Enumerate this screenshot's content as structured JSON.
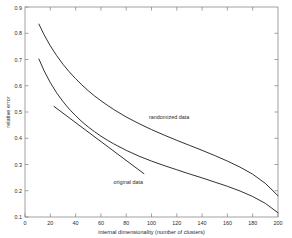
{
  "chart_data": {
    "type": "line",
    "title": "",
    "subtitle": "",
    "xlabel": "internal dimensionality (number of clusters)",
    "ylabel": "relative error",
    "xlim": [
      0,
      200
    ],
    "ylim": [
      0.1,
      0.9
    ],
    "grid": false,
    "legend_position": "inline-annotations",
    "xticks": [
      0,
      20,
      40,
      60,
      80,
      100,
      120,
      140,
      160,
      180,
      200
    ],
    "xtick_labels": [
      "0",
      "20",
      "40",
      "60",
      "80",
      "100",
      "120",
      "140",
      "160",
      "180",
      "200"
    ],
    "yticks": [
      0.1,
      0.2,
      0.3,
      0.4,
      0.5,
      0.6,
      0.7,
      0.8,
      0.9
    ],
    "ytick_labels": [
      "0.1",
      "0.2",
      "0.3",
      "0.4",
      "0.5",
      "0.6",
      "0.7",
      "0.8",
      "0.9"
    ],
    "series": [
      {
        "name": "randomized data",
        "x": [
          11,
          15,
          20,
          25,
          30,
          35,
          40,
          45,
          50,
          55,
          60,
          65,
          70,
          80,
          90,
          100,
          110,
          120,
          130,
          140,
          150,
          160,
          170,
          180,
          190,
          200
        ],
        "values": [
          0.835,
          0.795,
          0.752,
          0.715,
          0.682,
          0.653,
          0.627,
          0.603,
          0.581,
          0.561,
          0.543,
          0.526,
          0.51,
          0.481,
          0.456,
          0.433,
          0.412,
          0.392,
          0.373,
          0.354,
          0.334,
          0.313,
          0.29,
          0.263,
          0.228,
          0.181
        ]
      },
      {
        "name": "original data",
        "x": [
          11,
          15,
          20,
          25,
          30,
          35,
          40,
          45,
          50,
          55,
          60,
          65,
          70,
          80,
          90,
          100,
          110,
          120,
          130,
          140,
          150,
          160,
          170,
          180,
          190,
          200
        ],
        "values": [
          0.702,
          0.658,
          0.612,
          0.573,
          0.54,
          0.511,
          0.486,
          0.463,
          0.443,
          0.425,
          0.408,
          0.393,
          0.379,
          0.354,
          0.332,
          0.313,
          0.296,
          0.28,
          0.264,
          0.249,
          0.233,
          0.217,
          0.199,
          0.178,
          0.152,
          0.116
        ]
      },
      {
        "name": "tangent-line",
        "x": [
          23,
          94
        ],
        "values": [
          0.521,
          0.265
        ]
      }
    ],
    "annotations": [
      {
        "text": "randomized data",
        "x": 98,
        "y": 0.475
      },
      {
        "text": "original data",
        "x": 70,
        "y": 0.225
      }
    ]
  }
}
